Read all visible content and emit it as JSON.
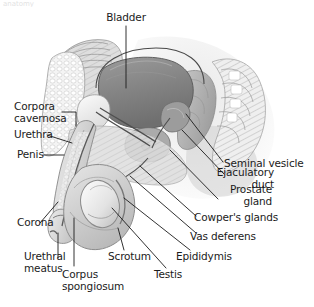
{
  "figure": {
    "style": "grayscale medical illustration",
    "background_color": "#ffffff",
    "leader_line_color": "#1b1b1b",
    "label_text_color": "#1b1b1b",
    "scan_artifact_text": "anatomy"
  },
  "labels": [
    {
      "id": "bladder",
      "text": "Bladder"
    },
    {
      "id": "corpora-cavernosa",
      "text": "Corpora\ncavernosa"
    },
    {
      "id": "urethra",
      "text": "Urethra"
    },
    {
      "id": "penis",
      "text": "Penis"
    },
    {
      "id": "corona",
      "text": "Corona"
    },
    {
      "id": "urethral-meatus",
      "text": "Urethral\nmeatus"
    },
    {
      "id": "corpus-spongiosum",
      "text": "Corpus\nspongiosum"
    },
    {
      "id": "scrotum",
      "text": "Scrotum"
    },
    {
      "id": "testis",
      "text": "Testis"
    },
    {
      "id": "epididymis",
      "text": "Epididymis"
    },
    {
      "id": "vas-deferens",
      "text": "Vas deferens"
    },
    {
      "id": "cowpers-glands",
      "text": "Cowper's glands"
    },
    {
      "id": "prostate-gland",
      "text": "Prostate\ngland"
    },
    {
      "id": "ejaculatory-duct",
      "text": "Ejaculatory\nduct"
    },
    {
      "id": "seminal-vesicle",
      "text": "Seminal vesicle"
    }
  ],
  "anatomy_structures": [
    {
      "id": "bladder-organ",
      "name": "bladder",
      "fill": "#8b8b8b"
    },
    {
      "id": "prostate-organ",
      "name": "prostate gland",
      "fill": "#a8a8a8"
    },
    {
      "id": "testis-organ",
      "name": "testis",
      "fill": "#e8e8e8"
    },
    {
      "id": "scrotum-sac",
      "name": "scrotum",
      "fill": "#cfcfcf"
    },
    {
      "id": "penis-shaft",
      "name": "penis shaft",
      "fill": "#c6c6c6"
    },
    {
      "id": "pubic-bone",
      "name": "pubic bone",
      "fill": "#f0f0f0"
    },
    {
      "id": "sacrum-bone",
      "name": "sacrum and coccyx",
      "fill": "#e2e2e2"
    },
    {
      "id": "abdominal-wall",
      "name": "abdominal wall",
      "fill": "#dcdcdc"
    },
    {
      "id": "rectum-body",
      "name": "rectum",
      "fill": "#b4b4b4"
    },
    {
      "id": "seminal-vesicle-organ",
      "name": "seminal vesicle",
      "fill": "#9a9a9a"
    }
  ]
}
